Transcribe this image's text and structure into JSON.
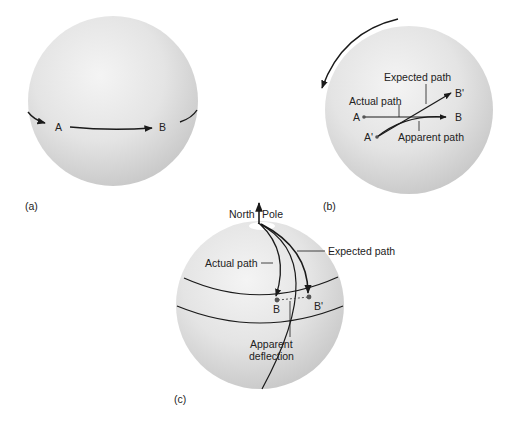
{
  "figure": {
    "panels": [
      {
        "id": "a",
        "caption": "(a)",
        "labels": {
          "point_a": "A",
          "point_b": "B"
        }
      },
      {
        "id": "b",
        "caption": "(b)",
        "labels": {
          "point_a": "A",
          "point_a_prime": "A'",
          "point_b": "B",
          "point_b_prime": "B'",
          "expected_path": "Expected path",
          "actual_path": "Actual path",
          "apparent_path": "Apparent path"
        },
        "rotation_arrow": "counterclockwise-rotation-arrow"
      },
      {
        "id": "c",
        "caption": "(c)",
        "labels": {
          "north": "North",
          "pole": "Pole",
          "actual_path": "Actual path",
          "expected_path": "Expected path",
          "point_b": "B",
          "point_b_prime": "B'",
          "apparent_line1": "Apparent",
          "apparent_line2": "deflection"
        }
      }
    ],
    "colors": {
      "background": "#ffffff",
      "sphere_light": "#f2f2f2",
      "sphere_mid": "#dedede",
      "sphere_dark": "#c4c4c4",
      "ink": "#1a1a1a",
      "point": "#555555"
    }
  }
}
